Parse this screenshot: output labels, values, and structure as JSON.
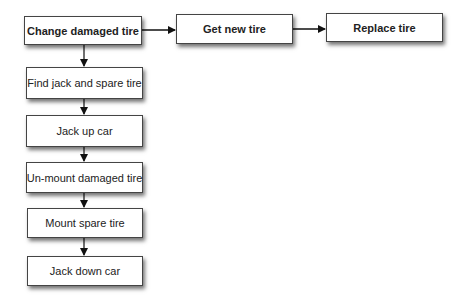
{
  "diagram": {
    "type": "flowchart",
    "nodes": [
      {
        "id": "change",
        "label": "Change damaged tire",
        "bold": true
      },
      {
        "id": "getnew",
        "label": "Get new tire",
        "bold": true
      },
      {
        "id": "replace",
        "label": "Replace tire",
        "bold": true
      },
      {
        "id": "find",
        "label": "Find jack and spare tire",
        "bold": false
      },
      {
        "id": "jackup",
        "label": "Jack up car",
        "bold": false
      },
      {
        "id": "unmount",
        "label": "Un-mount damaged tire",
        "bold": false
      },
      {
        "id": "mount",
        "label": "Mount spare tire",
        "bold": false
      },
      {
        "id": "jackdn",
        "label": "Jack down car",
        "bold": false
      }
    ],
    "edges": [
      {
        "from": "change",
        "to": "getnew"
      },
      {
        "from": "getnew",
        "to": "replace"
      },
      {
        "from": "change",
        "to": "find"
      },
      {
        "from": "find",
        "to": "jackup"
      },
      {
        "from": "jackup",
        "to": "unmount"
      },
      {
        "from": "unmount",
        "to": "mount"
      },
      {
        "from": "mount",
        "to": "jackdn"
      }
    ],
    "colors": {
      "border": "#444444",
      "arrow": "#111111",
      "text": "#222222"
    }
  }
}
